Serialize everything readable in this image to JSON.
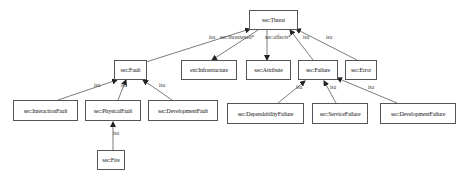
{
  "diagram": {
    "nodes": [
      {
        "id": "threat",
        "label": "sec:Threat",
        "x": 249,
        "y": 10,
        "w": 49,
        "h": 20
      },
      {
        "id": "fault",
        "label": "sec:Fault",
        "x": 114,
        "y": 60,
        "w": 33,
        "h": 20
      },
      {
        "id": "infra",
        "label": "ext:Infrastructure",
        "x": 181,
        "y": 60,
        "w": 56,
        "h": 20
      },
      {
        "id": "attribute",
        "label": "sec:Attribute",
        "x": 246,
        "y": 60,
        "w": 45,
        "h": 20
      },
      {
        "id": "failure",
        "label": "sec:Failure",
        "x": 298,
        "y": 60,
        "w": 40,
        "h": 20
      },
      {
        "id": "error",
        "label": "sec:Error",
        "x": 345,
        "y": 60,
        "w": 32,
        "h": 20
      },
      {
        "id": "interaction",
        "label": "sec:InteractionFault",
        "x": 13,
        "y": 100,
        "w": 65,
        "h": 21
      },
      {
        "id": "physical",
        "label": "sec:PhysicalFault",
        "x": 85,
        "y": 100,
        "w": 56,
        "h": 21
      },
      {
        "id": "devfault",
        "label": "sec:DevelopmentFault",
        "x": 148,
        "y": 100,
        "w": 70,
        "h": 21
      },
      {
        "id": "depfailure",
        "label": "sec:DependabilityFailure",
        "x": 227,
        "y": 103,
        "w": 77,
        "h": 21
      },
      {
        "id": "servfailure",
        "label": "sec:ServiceFailure",
        "x": 312,
        "y": 103,
        "w": 56,
        "h": 21
      },
      {
        "id": "devfailure",
        "label": "sec:DevelopmentFailure",
        "x": 380,
        "y": 103,
        "w": 76,
        "h": 21
      },
      {
        "id": "fire",
        "label": "sec:Fire",
        "x": 97,
        "y": 150,
        "w": 28,
        "h": 20
      }
    ],
    "edges": [
      {
        "from": "fault",
        "to": "threat",
        "label": "isa",
        "x1": 146,
        "y1": 62,
        "x2": 250,
        "y2": 29,
        "lx": 211,
        "ly": 38
      },
      {
        "from": "threat",
        "to": "infra",
        "label": "sec:threatened*",
        "x1": 258,
        "y1": 30,
        "x2": 212,
        "y2": 60,
        "lx": 222,
        "ly": 38
      },
      {
        "from": "threat",
        "to": "attribute",
        "label": "sec:affects*",
        "x1": 267,
        "y1": 30,
        "x2": 267,
        "y2": 60,
        "lx": 267,
        "ly": 38
      },
      {
        "from": "failure",
        "to": "threat",
        "label": "isa",
        "x1": 313,
        "y1": 60,
        "x2": 290,
        "y2": 30,
        "lx": 305,
        "ly": 38
      },
      {
        "from": "error",
        "to": "threat",
        "label": "isa",
        "x1": 357,
        "y1": 60,
        "x2": 296,
        "y2": 29,
        "lx": 328,
        "ly": 38
      },
      {
        "from": "interaction",
        "to": "fault",
        "label": "isa",
        "x1": 58,
        "y1": 100,
        "x2": 117,
        "y2": 80,
        "lx": 96,
        "ly": 86
      },
      {
        "from": "physical",
        "to": "fault",
        "label": "isa",
        "x1": 118,
        "y1": 100,
        "x2": 126,
        "y2": 80,
        "lx": 123,
        "ly": 86
      },
      {
        "from": "devfault",
        "to": "fault",
        "label": "isa",
        "x1": 172,
        "y1": 100,
        "x2": 143,
        "y2": 80,
        "lx": 161,
        "ly": 86
      },
      {
        "from": "depfailure",
        "to": "failure",
        "label": "isa",
        "x1": 278,
        "y1": 103,
        "x2": 305,
        "y2": 81,
        "lx": 298,
        "ly": 88
      },
      {
        "from": "servfailure",
        "to": "failure",
        "label": "isa",
        "x1": 336,
        "y1": 103,
        "x2": 324,
        "y2": 81,
        "lx": 332,
        "ly": 88
      },
      {
        "from": "devfailure",
        "to": "failure",
        "label": "isa",
        "x1": 397,
        "y1": 103,
        "x2": 337,
        "y2": 78,
        "lx": 370,
        "ly": 88
      },
      {
        "from": "fire",
        "to": "physical",
        "label": "isa",
        "x1": 113,
        "y1": 150,
        "x2": 113,
        "y2": 122,
        "lx": 115,
        "ly": 134
      }
    ]
  }
}
